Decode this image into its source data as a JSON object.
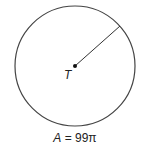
{
  "diagram": {
    "type": "circle",
    "center_label": "T",
    "area_label": "A = 99π",
    "area_value": "99π",
    "elements": [
      "circle",
      "center-point",
      "radius-segment"
    ],
    "colors": {
      "stroke": "#333333",
      "background": "#ffffff"
    }
  }
}
